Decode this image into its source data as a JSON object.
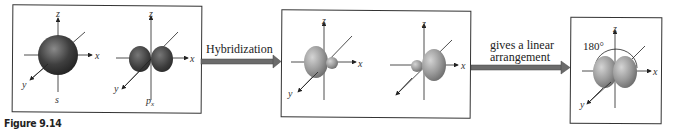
{
  "figure": {
    "caption": "Figure 9.14",
    "panels": [
      {
        "id": "atomic-orbitals",
        "orbitals": [
          {
            "name": "s",
            "label": "s",
            "shape": "sphere"
          },
          {
            "name": "px",
            "label": "p",
            "subscript": "x",
            "shape": "dumbbell"
          }
        ],
        "axes": {
          "x": "x",
          "y": "y",
          "z": "z"
        }
      },
      {
        "id": "hybrid-orbitals",
        "orbitals": [
          {
            "name": "sp-left",
            "shape": "hybrid-lobe-left"
          },
          {
            "name": "sp-right",
            "shape": "hybrid-lobe-right"
          }
        ],
        "axes": {
          "x": "x",
          "y": "y",
          "z": "z"
        }
      },
      {
        "id": "linear-arrangement",
        "angle_label": "180°",
        "axes": {
          "x": "x",
          "y": "y",
          "z": "z"
        }
      }
    ],
    "arrows": [
      {
        "label": "Hybridization"
      },
      {
        "label_line1": "gives a linear",
        "label_line2": "arrangement"
      }
    ],
    "colors": {
      "s_orbital": "#3a3a3a",
      "p_orbital": "#404040",
      "hybrid_orbital": "#8a8a8a",
      "arrow": "#6b6b6b",
      "border": "#333333"
    }
  }
}
